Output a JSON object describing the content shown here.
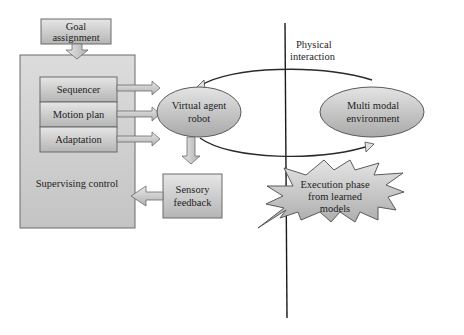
{
  "diagram": {
    "goal_box": {
      "lines": [
        "Goal",
        "assignment"
      ]
    },
    "supervising_control": {
      "label": "Supervising control"
    },
    "modules": [
      {
        "label": "Sequencer"
      },
      {
        "label": "Motion plan"
      },
      {
        "label": "Adaptation"
      }
    ],
    "virtual_agent": {
      "lines": [
        "Virtual agent",
        "robot"
      ]
    },
    "sensory_feedback": {
      "lines": [
        "Sensory",
        "feedback"
      ]
    },
    "environment": {
      "lines": [
        "Multi modal",
        "environment"
      ]
    },
    "physical_interaction": {
      "lines": [
        "Physical",
        "interaction"
      ]
    },
    "execution_phase": {
      "lines": [
        "Execution phase",
        "from learned",
        "models"
      ]
    }
  },
  "colors": {
    "box_fill_light": "#e2e2e2",
    "box_fill_dark": "#b9b9b9",
    "stroke": "#5a5a5a",
    "divider_line": "#1a1a1a"
  }
}
